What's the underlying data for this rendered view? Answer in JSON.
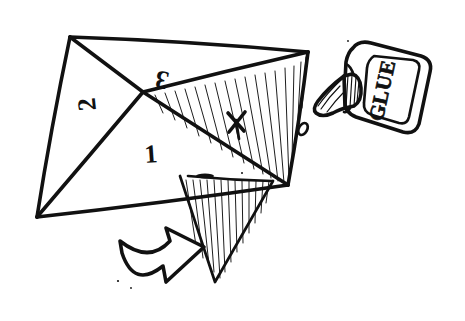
{
  "figure": {
    "background_color": "#ffffff",
    "ink_color": "#111111",
    "style": "hand-drawn pen sketch"
  },
  "labels": {
    "panel_one": "1",
    "panel_two": "2",
    "panel_three": "3",
    "glue_spot_mark": "X"
  },
  "glue_bottle": {
    "label_text": "GLUE",
    "label_orientation_deg": -90,
    "drop_present": true
  },
  "annotations": {
    "fold_arrow": "curved-fold-arrow-left",
    "hatched_regions": 2,
    "hatch_meaning": "underside / reverse face of paper"
  },
  "geometry": {
    "vertices": {
      "top_left": [
        70,
        37
      ],
      "top_right": [
        308,
        52
      ],
      "left": [
        37,
        217
      ],
      "right": [
        288,
        185
      ],
      "center": [
        143,
        92
      ],
      "lower_flap_tip": [
        215,
        282
      ]
    }
  }
}
